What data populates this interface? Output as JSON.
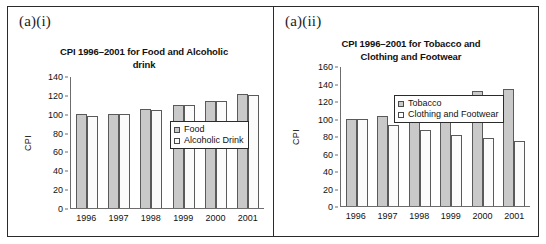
{
  "figure": {
    "panels": [
      {
        "label": "(a)(i)",
        "chart_ref": 0
      },
      {
        "label": "(a)(ii)",
        "chart_ref": 1
      }
    ]
  },
  "chart_data": [
    {
      "type": "bar",
      "title": "CPI 1996–2001 for Food and Alcoholic drink",
      "title_line1": "CPI 1996–2001 for Food and Alcoholic",
      "title_line2": "drink",
      "xlabel": "",
      "ylabel": "CPI",
      "categories": [
        "1996",
        "1997",
        "1998",
        "1999",
        "2000",
        "2001"
      ],
      "yticks": [
        0,
        20,
        40,
        60,
        80,
        100,
        120,
        140
      ],
      "ylim": [
        0,
        140
      ],
      "grid": false,
      "legend_position": "top-right",
      "series": [
        {
          "name": "Food",
          "values": [
            100,
            101,
            106,
            110,
            114,
            122
          ],
          "color": "#c9c9c9"
        },
        {
          "name": "Alcoholic Drink",
          "values": [
            98,
            101,
            105,
            110,
            114,
            121
          ],
          "color": "#fbfbfb"
        }
      ]
    },
    {
      "type": "bar",
      "title": "CPI 1996–2001 for Tobacco and Clothing and Footwear",
      "title_line1": "CPI 1996–2001 for Tobacco and",
      "title_line2": "Clothing and Footwear",
      "xlabel": "",
      "ylabel": "CPI",
      "categories": [
        "1996",
        "1997",
        "1998",
        "1999",
        "2000",
        "2001"
      ],
      "yticks": [
        0,
        20,
        40,
        60,
        80,
        100,
        120,
        140,
        160
      ],
      "ylim": [
        0,
        160
      ],
      "grid": false,
      "legend_position": "top-right",
      "series": [
        {
          "name": "Tobacco",
          "values": [
            100,
            104,
            108,
            114,
            132,
            135
          ],
          "color": "#c9c9c9"
        },
        {
          "name": "Clothing and Footwear",
          "values": [
            100,
            93,
            87,
            82,
            78,
            75
          ],
          "color": "#fbfbfb"
        }
      ]
    }
  ]
}
